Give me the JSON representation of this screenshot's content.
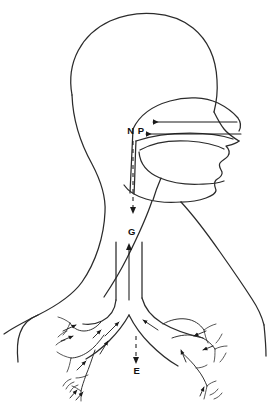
{
  "figure": {
    "background_color": "#ffffff",
    "line_color": "#2b2b2b",
    "arrow_color": "#1a1a1a"
  },
  "labels": [
    {
      "id": "np",
      "text": "N P",
      "meaning": "nasopharynx",
      "x": 136,
      "y": 134
    },
    {
      "id": "g",
      "text": "G",
      "meaning": "glottis",
      "x": 132,
      "y": 235
    },
    {
      "id": "e",
      "text": "E",
      "meaning": "expiration",
      "x": 137,
      "y": 374
    }
  ],
  "arrows": {
    "nasal_inflow_upper": {
      "name": "nasal-inflow-arrow",
      "direction": "leftward",
      "style": "solid"
    },
    "nasal_inflow_lower": {
      "name": "oral-inflow-arrow",
      "direction": "leftward",
      "style": "solid"
    },
    "np_descending": {
      "name": "nasopharynx-descending-arrow",
      "direction": "downward",
      "style": "dashed"
    },
    "trachea_ascending": {
      "name": "trachea-ascending-arrow",
      "direction": "upward",
      "style": "solid"
    },
    "expiration": {
      "name": "expiration-arrow",
      "direction": "downward",
      "style": "dashed"
    }
  },
  "structures": {
    "cranium": "cranium-outline",
    "face": "face-profile",
    "nasal_cavity": "nasal-cavity",
    "oral_cavity": "oral-cavity",
    "tongue": "tongue",
    "neck": "neck-outline",
    "shoulder_left": "left-shoulder",
    "shoulder_right": "right-shoulder",
    "trachea": "trachea",
    "carina": "carina",
    "bronchus_left": "left-main-bronchus",
    "bronchus_right": "right-main-bronchus",
    "bronchioles_left": "left-bronchioles",
    "bronchioles_right": "right-bronchioles"
  }
}
